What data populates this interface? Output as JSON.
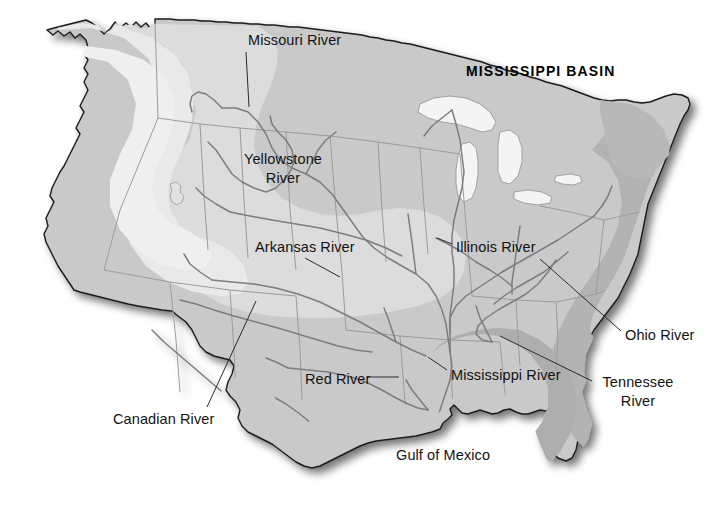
{
  "map": {
    "title": "MISSISSIPPI BASIN",
    "title_position": {
      "x": 466,
      "y": 63
    },
    "canvas": {
      "width": 723,
      "height": 515
    },
    "background_color": "#ffffff",
    "outline_color": "#1c1c1c",
    "river_color": "#7d7d7d",
    "state_border_color": "#9a9a9a",
    "leader_line_color": "#2b2b2b",
    "label_color": "#131313",
    "shading_bands": [
      {
        "name": "base-land",
        "color": "#c9c9c9"
      },
      {
        "name": "interior-plains-light",
        "color": "#dcdcdc"
      },
      {
        "name": "great-basin-lightest",
        "color": "#e9e9e9"
      },
      {
        "name": "appalachian-dark",
        "color": "#b0b0b0"
      },
      {
        "name": "coastal-dark",
        "color": "#a9a9a9"
      },
      {
        "name": "great-lakes",
        "color": "#f2f2f2"
      }
    ],
    "labels": [
      {
        "id": "missouri-river",
        "text": "Missouri River",
        "x": 248,
        "y": 31,
        "leader": {
          "x1": 246,
          "y1": 52,
          "x2": 249,
          "y2": 107
        }
      },
      {
        "id": "yellowstone-river",
        "text": "Yellowstone\nRiver",
        "x": 238,
        "y": 150,
        "width": 90,
        "leader": null
      },
      {
        "id": "arkansas-river",
        "text": "Arkansas River",
        "x": 255,
        "y": 238,
        "leader": {
          "x1": 305,
          "y1": 258,
          "x2": 340,
          "y2": 277
        }
      },
      {
        "id": "illinois-river",
        "text": "Illinois River",
        "x": 456,
        "y": 238,
        "leader": {
          "x1": 452,
          "y1": 244,
          "x2": 437,
          "y2": 238
        }
      },
      {
        "id": "ohio-river",
        "text": "Ohio River",
        "x": 625,
        "y": 326,
        "leader": {
          "x1": 621,
          "y1": 331,
          "x2": 540,
          "y2": 259
        }
      },
      {
        "id": "tennessee-river",
        "text": "Tennessee\nRiver",
        "x": 595,
        "y": 373,
        "width": 86,
        "leader": {
          "x1": 592,
          "y1": 381,
          "x2": 500,
          "y2": 336
        }
      },
      {
        "id": "mississippi-river",
        "text": "Mississippi River",
        "x": 451,
        "y": 366,
        "leader": {
          "x1": 447,
          "y1": 370,
          "x2": 428,
          "y2": 357
        }
      },
      {
        "id": "red-river",
        "text": "Red River",
        "x": 305,
        "y": 370,
        "leader": {
          "x1": 367,
          "y1": 377,
          "x2": 399,
          "y2": 377
        }
      },
      {
        "id": "canadian-river",
        "text": "Canadian River",
        "x": 113,
        "y": 410,
        "leader": {
          "x1": 207,
          "y1": 407,
          "x2": 256,
          "y2": 301
        }
      },
      {
        "id": "gulf-of-mexico",
        "text": "Gulf of Mexico",
        "x": 396,
        "y": 446,
        "leader": null
      }
    ]
  }
}
